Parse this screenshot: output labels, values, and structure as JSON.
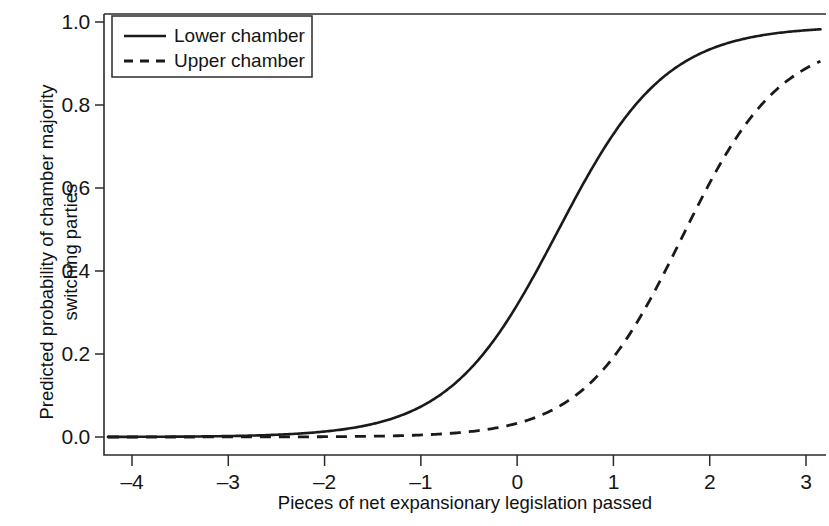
{
  "chart_data": {
    "type": "line",
    "title": "",
    "subtitle": "",
    "xlabel": "Pieces of net expansionary legislation passed",
    "ylabel": "Predicted probability of chamber majority switching parties",
    "ylabel_line1": "Predicted probability of chamber majority",
    "ylabel_line2": "switching parties",
    "xlim": [
      -4.25,
      3.15
    ],
    "ylim": [
      -0.04,
      1.04
    ],
    "xticks": [
      -4,
      -3,
      -2,
      -1,
      0,
      1,
      2,
      3
    ],
    "xticklabels": [
      "–4",
      "–3",
      "–2",
      "–1",
      "0",
      "1",
      "2",
      "3"
    ],
    "yticks": [
      0.0,
      0.2,
      0.4,
      0.6,
      0.8,
      1.0
    ],
    "yticklabels": [
      "0.0",
      "0.2",
      "0.4",
      "0.6",
      "0.8",
      "1.0"
    ],
    "grid": false,
    "legend_position": "upper left",
    "series": [
      {
        "name": "Lower chamber",
        "style": "solid",
        "color": "#1a1a1a",
        "midpoint": 0.42,
        "slope": 1.78,
        "asymptote": 0.99,
        "x": [
          -4,
          -3.5,
          -3,
          -2.5,
          -2,
          -1.5,
          -1,
          -0.5,
          0,
          0.25,
          0.5,
          0.75,
          1,
          1.25,
          1.5,
          2,
          2.5,
          3
        ],
        "values": [
          0.005,
          0.008,
          0.013,
          0.021,
          0.034,
          0.055,
          0.087,
          0.137,
          0.21,
          0.26,
          0.32,
          0.39,
          0.47,
          0.55,
          0.63,
          0.77,
          0.88,
          0.98
        ]
      },
      {
        "name": "Upper chamber",
        "style": "dashed",
        "color": "#1a1a1a",
        "midpoint": 1.71,
        "slope": 1.95,
        "asymptote": 0.96,
        "x": [
          -4,
          -3.5,
          -3,
          -2.5,
          -2,
          -1.5,
          -1,
          -0.5,
          0,
          0.5,
          0.75,
          1,
          1.25,
          1.5,
          1.75,
          2,
          2.25,
          2.5,
          3
        ],
        "values": [
          0.002,
          0.003,
          0.004,
          0.006,
          0.009,
          0.013,
          0.02,
          0.031,
          0.048,
          0.095,
          0.13,
          0.18,
          0.25,
          0.33,
          0.43,
          0.53,
          0.63,
          0.72,
          0.94
        ]
      }
    ]
  },
  "legend": {
    "items": [
      {
        "label": "Lower chamber",
        "style": "solid"
      },
      {
        "label": "Upper chamber",
        "style": "dashed"
      }
    ]
  },
  "axes": {
    "x_title": "Pieces of net expansionary legislation passed",
    "y_title_line1": "Predicted probability of chamber majority",
    "y_title_line2": "switching parties"
  }
}
